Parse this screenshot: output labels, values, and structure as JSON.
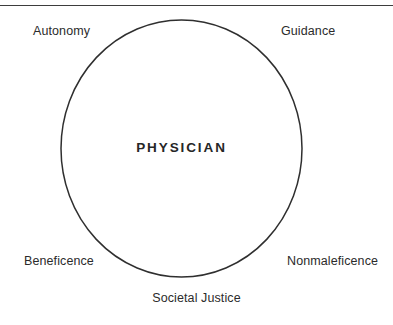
{
  "figure": {
    "caption_remnant": "Physician Ethics Diagram",
    "background_color": "#ffffff",
    "stroke_color": "#2f2f2f",
    "text_color": "#2b2b2b"
  },
  "rule": {
    "color": "#3d3d3d"
  },
  "circle": {
    "center_label": "PHYSICIAN",
    "cx": 181.5,
    "cy": 148.5,
    "rx": 120.5,
    "ry": 128.5,
    "stroke_color": "#2f2f2f",
    "stroke_width": 1.5,
    "fill": "none"
  },
  "labels": {
    "top_left": "Autonomy",
    "top_right": "Guidance",
    "bottom_left": "Beneficence",
    "bottom_right": "Nonmaleficence",
    "bottom_center": "Societal Justice"
  }
}
